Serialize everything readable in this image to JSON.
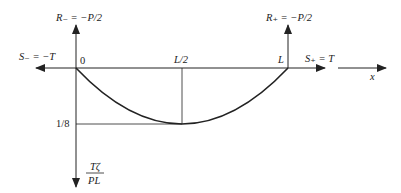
{
  "diagram": {
    "type": "deflection-diagram",
    "labels": {
      "reaction_left": "R₋ = −P/2",
      "reaction_right": "R₊ = −P/2",
      "force_left": "S₋ = −T",
      "force_right": "S₊ = T",
      "origin": "0",
      "midpoint": "L/2",
      "end": "L",
      "x_axis": "x",
      "min_value": "1/8",
      "y_axis_numerator": "Tζ",
      "y_axis_denominator": "PL"
    },
    "colors": {
      "line": "#222222",
      "text": "#222222"
    }
  }
}
